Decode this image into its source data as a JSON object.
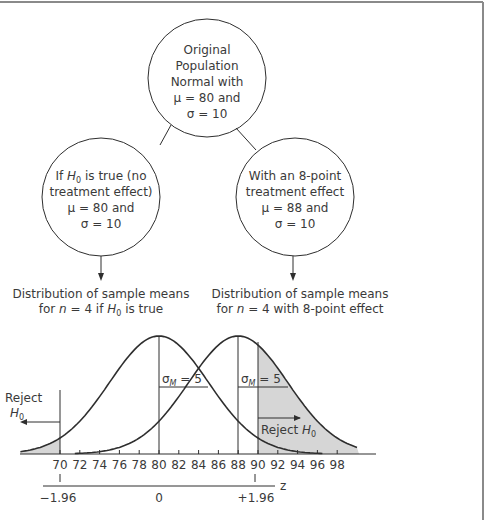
{
  "diagram": {
    "top_node": {
      "lines": [
        "Original",
        "Population",
        "Normal with",
        "μ = 80 and",
        "σ = 10"
      ]
    },
    "left_node": {
      "line1_pre": "If ",
      "line1_H": "H",
      "line1_sub": "0",
      "line1_post": " is true (no",
      "line2": "treatment effect)",
      "line3": "μ = 80 and",
      "line4": "σ = 10"
    },
    "right_node": {
      "line1": "With an 8-point",
      "line2": "treatment effect",
      "line3": "μ = 88 and",
      "line4": "σ = 10"
    },
    "left_caption": {
      "line1": "Distribution of sample means",
      "line2_pre": "for ",
      "line2_n": "n",
      "line2_mid": " = 4 if ",
      "line2_H": "H",
      "line2_sub": "0",
      "line2_post": " is true"
    },
    "right_caption": {
      "line1": "Distribution of sample means",
      "line2_pre": "for ",
      "line2_n": "n",
      "line2_post": " = 4 with 8-point effect"
    }
  },
  "graph": {
    "sigma_label_left": {
      "sym": "σ",
      "sub": "M",
      "rest": " = 5"
    },
    "sigma_label_right": {
      "sym": "σ",
      "sub": "M",
      "rest": " = 5"
    },
    "reject_left": {
      "word": "Reject",
      "H": "H",
      "sub": "0"
    },
    "reject_right": {
      "word": "Reject ",
      "H": "H",
      "sub": "0"
    },
    "x_ticks": [
      "70",
      "72",
      "74",
      "76",
      "78",
      "80",
      "82",
      "84",
      "86",
      "88",
      "90",
      "92",
      "94",
      "96",
      "98"
    ],
    "z_labels": {
      "left": "−1.96",
      "center": "0",
      "right": "+1.96",
      "axis": "z"
    },
    "colors": {
      "shade": "#d6d6d6",
      "line": "#2e2e2e",
      "text": "#3a3a3a"
    }
  },
  "chart_data": {
    "type": "line",
    "title": "",
    "xlabel": "",
    "ylabel": "",
    "series": [
      {
        "name": "Distribution of sample means for n = 4 if H0 is true",
        "mean": 80,
        "sd": 5
      },
      {
        "name": "Distribution of sample means for n = 4 with 8-point effect",
        "mean": 88,
        "sd": 5
      }
    ],
    "x_ticks": [
      70,
      72,
      74,
      76,
      78,
      80,
      82,
      84,
      86,
      88,
      90,
      92,
      94,
      96,
      98
    ],
    "z_ticks": [
      {
        "x": 70,
        "z": -1.96
      },
      {
        "x": 80,
        "z": 0
      },
      {
        "x": 90,
        "z": 1.96
      }
    ],
    "critical_region": {
      "lower": 70,
      "upper": 90,
      "label": "Reject H0"
    },
    "annotations": [
      "σM = 5",
      "σM = 5",
      "Reject H0",
      "Reject H0"
    ]
  }
}
